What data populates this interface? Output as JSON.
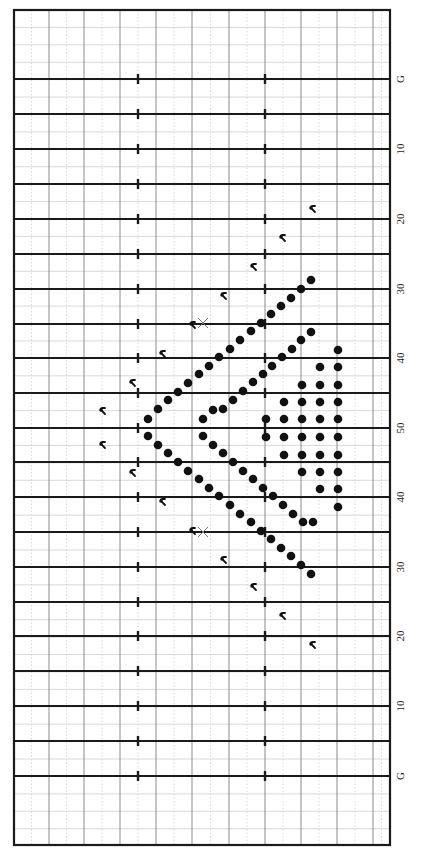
{
  "diagram": {
    "type": "marching-band-drill-chart",
    "orientation": "field rotated 90deg; end zones at top and bottom; sideline labels on right",
    "colors": {
      "background": "#ffffff",
      "border": "#1a1a1a",
      "yard_line": "#1a1a1a",
      "grid_major": "#8a8a8a",
      "grid_minor": "#cfcfcf",
      "dot": "#111111",
      "marker": "#111111",
      "x_mark": "#777777",
      "label": "#222222"
    },
    "field": {
      "left": 14,
      "right": 390,
      "top": 10,
      "bottom": 845
    },
    "yard_lines": [
      {
        "y": 79,
        "label": "G"
      },
      {
        "y": 114,
        "label": ""
      },
      {
        "y": 149,
        "label": "10"
      },
      {
        "y": 184,
        "label": ""
      },
      {
        "y": 219,
        "label": "20"
      },
      {
        "y": 254,
        "label": ""
      },
      {
        "y": 289,
        "label": "30"
      },
      {
        "y": 324,
        "label": ""
      },
      {
        "y": 358,
        "label": "40"
      },
      {
        "y": 393,
        "label": ""
      },
      {
        "y": 428,
        "label": "50"
      },
      {
        "y": 462,
        "label": ""
      },
      {
        "y": 497,
        "label": "40"
      },
      {
        "y": 532,
        "label": ""
      },
      {
        "y": 567,
        "label": "30"
      },
      {
        "y": 602,
        "label": ""
      },
      {
        "y": 636,
        "label": "20"
      },
      {
        "y": 671,
        "label": ""
      },
      {
        "y": 706,
        "label": "10"
      },
      {
        "y": 741,
        "label": ""
      },
      {
        "y": 776,
        "label": "G"
      }
    ],
    "hash_marks_x": [
      138,
      265
    ],
    "vertical_major_x": [
      49,
      84,
      120,
      156,
      192,
      229,
      265,
      301,
      337,
      373
    ],
    "label_x": 400,
    "performers": {
      "outer_diagonal_upper": [
        [
          311,
          280
        ],
        [
          301,
          289
        ],
        [
          291,
          298
        ],
        [
          281,
          306
        ],
        [
          271,
          314
        ],
        [
          261,
          323
        ],
        [
          251,
          331
        ],
        [
          240,
          340
        ],
        [
          230,
          349
        ],
        [
          219,
          357
        ],
        [
          209,
          366
        ],
        [
          199,
          374
        ],
        [
          188,
          383
        ],
        [
          178,
          392
        ],
        [
          168,
          400
        ],
        [
          158,
          409
        ],
        [
          148,
          419
        ]
      ],
      "outer_diagonal_lower": [
        [
          148,
          436
        ],
        [
          158,
          445
        ],
        [
          168,
          453
        ],
        [
          178,
          462
        ],
        [
          188,
          471
        ],
        [
          199,
          479
        ],
        [
          209,
          488
        ],
        [
          219,
          496
        ],
        [
          230,
          505
        ],
        [
          240,
          514
        ],
        [
          251,
          522
        ],
        [
          261,
          531
        ],
        [
          271,
          539
        ],
        [
          281,
          548
        ],
        [
          291,
          556
        ],
        [
          301,
          565
        ],
        [
          311,
          574
        ]
      ],
      "inner_diagonal_upper": [
        [
          311,
          332
        ],
        [
          301,
          340
        ],
        [
          292,
          349
        ],
        [
          282,
          357
        ],
        [
          272,
          366
        ],
        [
          263,
          374
        ],
        [
          253,
          382
        ],
        [
          243,
          391
        ],
        [
          233,
          400
        ],
        [
          223,
          409
        ],
        [
          213,
          410
        ],
        [
          203,
          419
        ]
      ],
      "inner_diagonal_lower": [
        [
          203,
          436
        ],
        [
          213,
          445
        ],
        [
          223,
          453
        ],
        [
          233,
          462
        ],
        [
          243,
          471
        ],
        [
          253,
          479
        ],
        [
          263,
          488
        ],
        [
          273,
          496
        ],
        [
          283,
          505
        ],
        [
          293,
          514
        ],
        [
          303,
          522
        ],
        [
          313,
          522
        ]
      ],
      "block": [
        [
          338,
          350
        ],
        [
          320,
          367
        ],
        [
          338,
          367
        ],
        [
          302,
          385
        ],
        [
          320,
          385
        ],
        [
          338,
          385
        ],
        [
          284,
          402
        ],
        [
          302,
          402
        ],
        [
          320,
          402
        ],
        [
          338,
          402
        ],
        [
          266,
          419
        ],
        [
          284,
          419
        ],
        [
          302,
          419
        ],
        [
          320,
          419
        ],
        [
          338,
          419
        ],
        [
          266,
          437
        ],
        [
          284,
          437
        ],
        [
          302,
          437
        ],
        [
          320,
          437
        ],
        [
          338,
          437
        ],
        [
          284,
          455
        ],
        [
          302,
          455
        ],
        [
          320,
          455
        ],
        [
          338,
          455
        ],
        [
          302,
          472
        ],
        [
          320,
          472
        ],
        [
          338,
          472
        ],
        [
          320,
          489
        ],
        [
          338,
          489
        ],
        [
          338,
          507
        ]
      ]
    },
    "markers": [
      [
        311,
        209
      ],
      [
        281,
        238
      ],
      [
        252,
        267
      ],
      [
        222,
        296
      ],
      [
        191,
        325
      ],
      [
        161,
        354
      ],
      [
        131,
        383
      ],
      [
        101,
        411
      ],
      [
        101,
        445
      ],
      [
        131,
        473
      ],
      [
        161,
        502
      ],
      [
        191,
        531
      ],
      [
        222,
        560
      ],
      [
        252,
        587
      ],
      [
        281,
        616
      ],
      [
        311,
        645
      ]
    ],
    "x_marks": [
      [
        203,
        323
      ],
      [
        203,
        532
      ]
    ]
  }
}
